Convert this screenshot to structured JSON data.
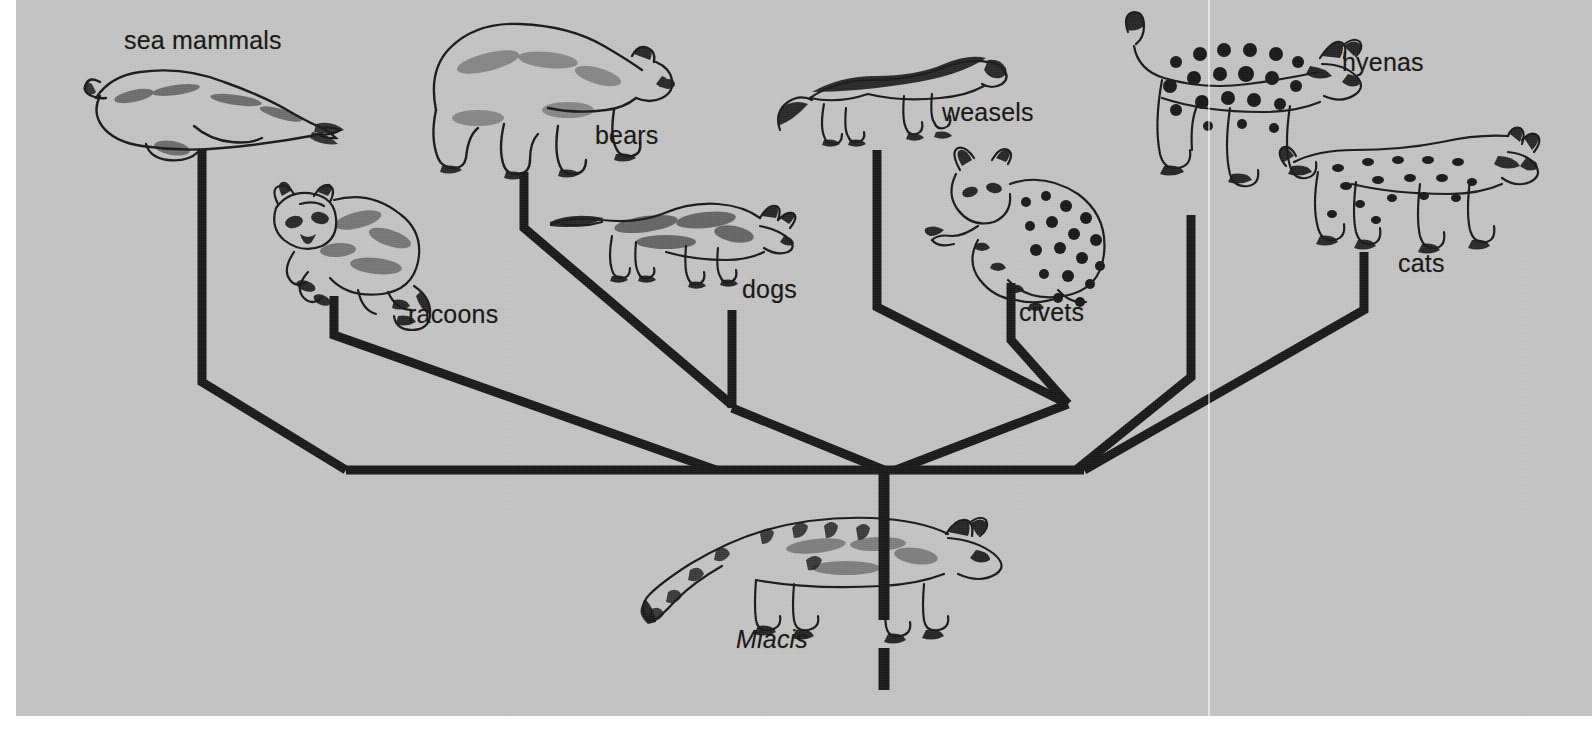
{
  "figure": {
    "kind": "cladogram",
    "background_color": "#c5c5c5",
    "ink_color": "#171717",
    "page_color": "#ffffff"
  },
  "labels": {
    "sea_mammals": "sea mammals",
    "racoons": "racoons",
    "bears": "bears",
    "dogs": "dogs",
    "weasels": "weasels",
    "civets": "civets",
    "hyenas": "hyenas",
    "cats": "cats",
    "miacis": "Miacis"
  },
  "tree": {
    "root_label": "Miacis",
    "tips": [
      {
        "id": "sea_mammals",
        "label": "sea mammals",
        "icon": "seal-illustration"
      },
      {
        "id": "racoons",
        "label": "racoons",
        "icon": "raccoon-illustration"
      },
      {
        "id": "bears",
        "label": "bears",
        "icon": "bear-illustration"
      },
      {
        "id": "dogs",
        "label": "dogs",
        "icon": "fox-illustration"
      },
      {
        "id": "weasels",
        "label": "weasels",
        "icon": "weasel-illustration"
      },
      {
        "id": "civets",
        "label": "civets",
        "icon": "civet-illustration"
      },
      {
        "id": "hyenas",
        "label": "hyenas",
        "icon": "hyena-illustration"
      },
      {
        "id": "cats",
        "label": "cats",
        "icon": "lynx-illustration"
      }
    ],
    "clades": [
      {
        "id": "arctoid-left",
        "members": [
          "sea_mammals",
          "racoons"
        ]
      },
      {
        "id": "caniform",
        "members": [
          "sea_mammals",
          "racoons",
          "bears",
          "dogs"
        ]
      },
      {
        "id": "feliform-inner",
        "members": [
          "weasels",
          "civets"
        ]
      },
      {
        "id": "feliform",
        "members": [
          "weasels",
          "civets",
          "hyenas",
          "cats"
        ]
      },
      {
        "id": "carnivora",
        "members": [
          "sea_mammals",
          "racoons",
          "bears",
          "dogs",
          "weasels",
          "civets",
          "hyenas",
          "cats"
        ]
      }
    ]
  }
}
